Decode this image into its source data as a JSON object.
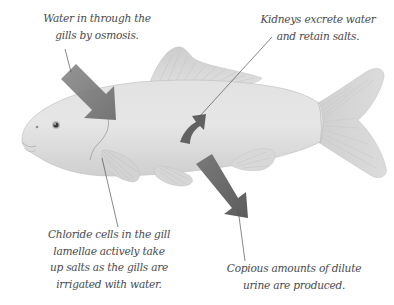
{
  "diagram": {
    "colors": {
      "background": "#ffffff",
      "fish_body": "#d9d9d9",
      "fish_fin": "#d4d4d4",
      "arrow_dark": "#6a6a6a",
      "arrow_light": "#8a8a8a",
      "leader_line": "#555555",
      "label_text": "#4a4a4a"
    },
    "labels": {
      "water_in": {
        "lines": [
          "Water in through the",
          "gills by osmosis."
        ]
      },
      "kidneys": {
        "lines": [
          "Kidneys excrete water",
          "and retain salts."
        ]
      },
      "chloride": {
        "lines": [
          "Chloride cells in the gill",
          "lamellae actively take",
          "up salts as the gills are",
          "irrigated with water."
        ]
      },
      "urine": {
        "lines": [
          "Copious amounts of dilute",
          "urine are produced."
        ]
      }
    },
    "arrows": [
      {
        "name": "water-inflow-arrow",
        "direction": "into gills"
      },
      {
        "name": "kidney-curved-arrow",
        "direction": "curved upward"
      },
      {
        "name": "urine-outflow-arrow",
        "direction": "out of body"
      }
    ]
  }
}
